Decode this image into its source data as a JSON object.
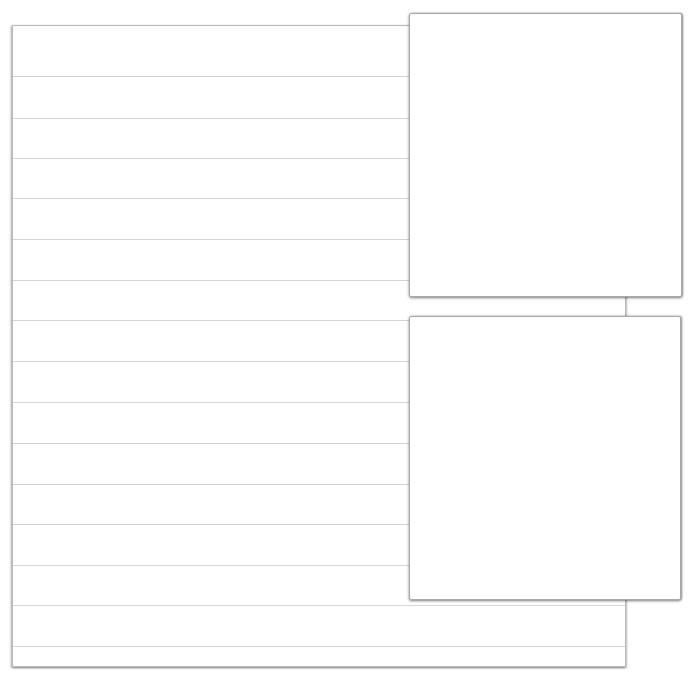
{
  "header": {
    "clipped_text": ""
  },
  "page": {
    "type": "lined-paper",
    "line_color": "#d6d6d6",
    "line_count": 15,
    "line_offsets_px": [
      50,
      92,
      132,
      172,
      213,
      254,
      294,
      335,
      376,
      417,
      458,
      498,
      539,
      579,
      620
    ]
  },
  "cards": [
    {
      "id": "card-1",
      "content": ""
    },
    {
      "id": "card-2",
      "content": ""
    }
  ]
}
